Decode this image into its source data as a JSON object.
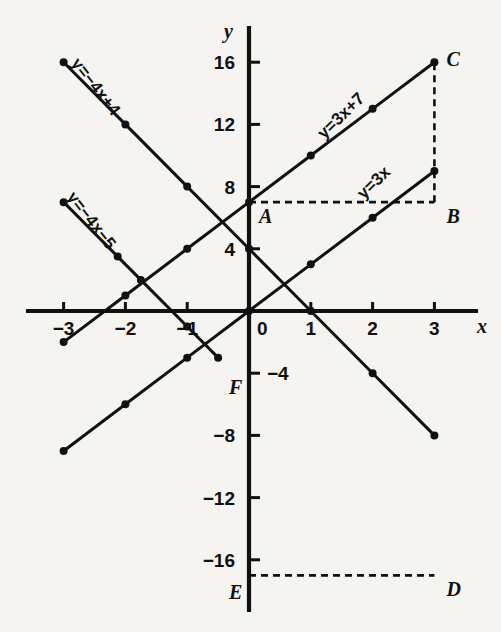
{
  "chart_data": {
    "type": "line",
    "title": "",
    "xlabel": "x",
    "ylabel": "y",
    "xlim": [
      -3.5,
      3.6
    ],
    "ylim": [
      -18.5,
      17.5
    ],
    "grid": false,
    "legend": "inline-labels",
    "x_ticks": [
      -3,
      -2,
      -1,
      0,
      1,
      2,
      3
    ],
    "x_tick_labels": [
      "−3",
      "−2",
      "−1",
      "0",
      "1",
      "2",
      "3"
    ],
    "y_ticks": [
      16,
      12,
      8,
      4,
      -4,
      -8,
      -12,
      -16
    ],
    "y_tick_labels": [
      "16",
      "12",
      "8",
      "4",
      "−4",
      "−8",
      "−12",
      "−16"
    ],
    "series": [
      {
        "name": "y=3x+7",
        "label": "y=3x+7",
        "slope": 3,
        "intercept": 7,
        "x": [
          -3,
          -2,
          -1,
          0,
          1,
          2,
          3
        ],
        "values": [
          -2,
          1,
          4,
          7,
          10,
          13,
          16
        ],
        "label_x": 1.55,
        "label_y": 12.3,
        "label_rotation": -44
      },
      {
        "name": "y=3x",
        "label": "y=3x",
        "slope": 3,
        "intercept": 0,
        "x": [
          -3,
          -2,
          -1,
          0,
          1,
          2,
          3
        ],
        "values": [
          -9,
          -6,
          -3,
          0,
          3,
          6,
          9
        ],
        "label_x": 2.08,
        "label_y": 8.0,
        "label_rotation": -44
      },
      {
        "name": "y=-4x+4",
        "label": "y=−4x+4",
        "slope": -4,
        "intercept": 4,
        "x": [
          -3,
          -2,
          -1,
          0,
          1,
          2,
          3
        ],
        "values": [
          16,
          12,
          8,
          4,
          0,
          -4,
          -8
        ],
        "label_x": -2.55,
        "label_y": 14.2,
        "label_rotation": 52
      },
      {
        "name": "y=-4x-5",
        "label": "y=−4x−5",
        "slope": -4,
        "intercept": -5,
        "x": [
          -3,
          -2.125,
          -1.75,
          -1,
          -0.5
        ],
        "values": [
          7,
          3.5,
          2,
          -1,
          -3
        ],
        "label_x": -2.62,
        "label_y": 5.6,
        "label_rotation": 52
      }
    ],
    "annotations": [
      {
        "name": "A",
        "label": "A",
        "x": 0,
        "y": 7,
        "label_dx": 10,
        "label_dy": 21
      },
      {
        "name": "B",
        "label": "B",
        "x": 3,
        "y": 7,
        "label_dx": 12,
        "label_dy": 21
      },
      {
        "name": "C",
        "label": "C",
        "x": 3,
        "y": 16,
        "label_dx": 12,
        "label_dy": 4
      },
      {
        "name": "D",
        "label": "D",
        "x": 3,
        "y": -17,
        "label_dx": 12,
        "label_dy": 21
      },
      {
        "name": "E",
        "label": "E",
        "x": 0,
        "y": -17,
        "label_dx": -20,
        "label_dy": 24
      },
      {
        "name": "F",
        "label": "F",
        "x": 0,
        "y": -5,
        "label_dx": -20,
        "label_dy": 5
      }
    ],
    "dashed_segments": [
      {
        "name": "A-to-B",
        "x1": 0,
        "y1": 7,
        "x2": 3,
        "y2": 7
      },
      {
        "name": "B-to-C",
        "x1": 3,
        "y1": 7,
        "x2": 3,
        "y2": 16
      },
      {
        "name": "E-to-D",
        "x1": 0,
        "y1": -17,
        "x2": 3,
        "y2": -17
      }
    ],
    "colors": {
      "background": "#f6f4f1",
      "ink": "#111111",
      "axis": "#111111"
    }
  }
}
